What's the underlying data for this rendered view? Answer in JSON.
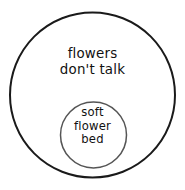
{
  "diagram": {
    "type": "nested-circles",
    "background_color": "#ffffff",
    "outer_set": {
      "name": "flowers-dont-talk",
      "shape": "circle",
      "center_x": 92.5,
      "center_y": 95,
      "radius": 82.5,
      "stroke_color": "#1a1a1a",
      "stroke_width": 2,
      "fill": "none",
      "label_lines": [
        "flowers",
        "don't talk"
      ]
    },
    "inner_set": {
      "name": "soft-flower-bed",
      "shape": "circle",
      "center_x": 93.5,
      "center_y": 135,
      "radius": 33,
      "stroke_color": "#555555",
      "stroke_width": 1.5,
      "fill": "none",
      "label_lines": [
        "soft",
        "flower",
        "bed"
      ]
    }
  }
}
